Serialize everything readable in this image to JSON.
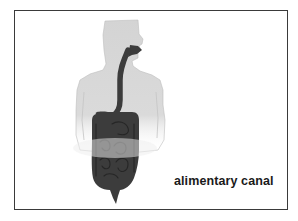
{
  "diagram": {
    "label": "alimentary canal",
    "colors": {
      "frame": "#3a3a3a",
      "body_silhouette": "#d6d6d6",
      "canal": "#3c3c3c",
      "canal_detail": "#262626",
      "text": "#1a1a1a",
      "background": "#ffffff"
    },
    "parts": [
      "head",
      "torso",
      "esophagus",
      "stomach",
      "small intestine",
      "large intestine",
      "rectum"
    ]
  }
}
